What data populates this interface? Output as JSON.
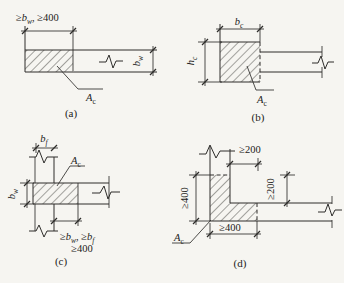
{
  "colors": {
    "ink": "#2e2d2b",
    "paper": "#f6f5f1"
  },
  "figures": {
    "a": {
      "caption": "(a)",
      "top_dim": {
        "ge": "≥",
        "var": "b",
        "sub": "w",
        "rest": ", ≥400"
      },
      "thickness_dim": {
        "var": "b",
        "sub": "w"
      },
      "area": {
        "var": "A",
        "sub": "c"
      }
    },
    "b": {
      "caption": "(b)",
      "width_dim": {
        "var": "b",
        "sub": "c"
      },
      "height_dim": {
        "var": "h",
        "sub": "c"
      },
      "area": {
        "var": "A",
        "sub": "c"
      }
    },
    "c": {
      "caption": "(c)",
      "flange_dim": {
        "var": "b",
        "sub": "f"
      },
      "web_dim": {
        "var": "b",
        "sub": "w"
      },
      "end_dim": {
        "ge1": "≥",
        "var1": "b",
        "sub1": "w",
        "mid": ", ≥",
        "var2": "b",
        "sub2": "f",
        "line2": "≥400"
      },
      "area": {
        "var": "A",
        "sub": "c"
      }
    },
    "d": {
      "caption": "(d)",
      "top_dim": "≥200",
      "right_dim": "≥200",
      "left_dim": "≥400",
      "bottom_dim": "≥400",
      "area": {
        "var": "A",
        "sub": "c"
      }
    }
  }
}
